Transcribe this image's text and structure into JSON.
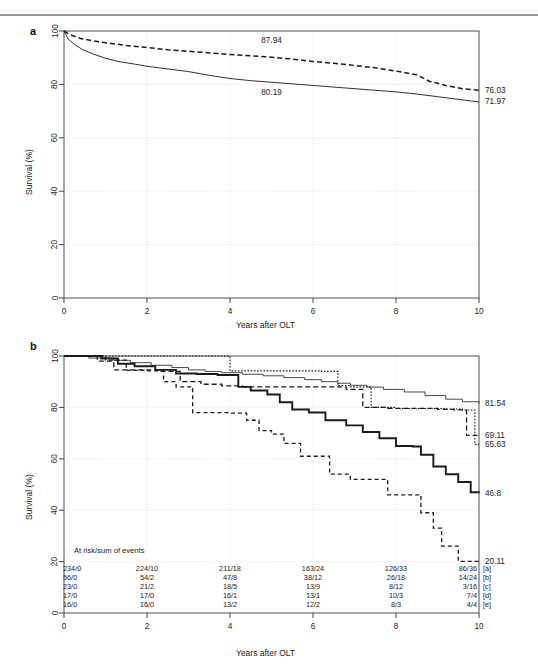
{
  "figure": {
    "panel_a_letter": "a",
    "panel_b_letter": "b",
    "axis": {
      "xlabel": "Years after OLT",
      "ylabel": "Survival (%)",
      "xticks": [
        "0",
        "2",
        "4",
        "6",
        "8",
        "10"
      ],
      "yticks": [
        "0",
        "20",
        "40",
        "60",
        "80",
        "100"
      ]
    }
  },
  "chart_data": [
    {
      "type": "line",
      "panel": "a",
      "title": "",
      "xlabel": "Years after OLT",
      "ylabel": "Survival (%)",
      "xlim": [
        0,
        10
      ],
      "ylim": [
        0,
        100
      ],
      "xticks": [
        0,
        2,
        4,
        6,
        8,
        10
      ],
      "yticks": [
        0,
        20,
        40,
        60,
        80,
        100
      ],
      "grid": true,
      "legend": "none",
      "annotations": [
        {
          "text": "87.94",
          "x": 5.0,
          "y": 95.5,
          "series": "dashed"
        },
        {
          "text": "80.19",
          "x": 5.0,
          "y": 76.0,
          "series": "solid"
        }
      ],
      "end_labels": [
        {
          "text": "76.03",
          "series": "dashed"
        },
        {
          "text": "71.97",
          "series": "solid"
        }
      ],
      "series": [
        {
          "name": "dashed",
          "style": "dashed",
          "x": [
            0,
            0.15,
            0.4,
            0.7,
            1.0,
            1.5,
            2.0,
            2.5,
            3.0,
            3.5,
            4.0,
            4.5,
            5.0,
            5.5,
            6.0,
            6.5,
            7.0,
            7.5,
            8.0,
            8.5,
            8.8,
            9.2,
            9.6,
            10.0
          ],
          "values": [
            100,
            98.6,
            97.2,
            96.3,
            95.6,
            94.6,
            93.8,
            93.0,
            92.4,
            91.8,
            91.2,
            90.7,
            90.2,
            89.5,
            88.6,
            87.9,
            87.1,
            86.2,
            85.0,
            83.6,
            81.2,
            79.6,
            78.4,
            77.8
          ]
        },
        {
          "name": "solid",
          "style": "solid",
          "x": [
            0,
            0.1,
            0.25,
            0.45,
            0.7,
            1.0,
            1.3,
            1.7,
            2.0,
            2.3,
            2.7,
            3.0,
            3.5,
            4.0,
            4.5,
            5.0,
            5.5,
            6.0,
            6.5,
            7.0,
            7.5,
            8.0,
            8.5,
            9.0,
            9.5,
            10.0
          ],
          "values": [
            100,
            97.0,
            95.0,
            93.0,
            91.4,
            89.8,
            88.6,
            87.6,
            86.8,
            86.2,
            85.4,
            84.8,
            83.4,
            82.2,
            81.4,
            80.8,
            80.2,
            79.6,
            79.0,
            78.4,
            77.8,
            77.2,
            76.4,
            75.4,
            74.4,
            73.4
          ]
        }
      ]
    },
    {
      "type": "line",
      "panel": "b",
      "title": "",
      "xlabel": "Years after OLT",
      "ylabel": "Survival (%)",
      "xlim": [
        0,
        10
      ],
      "ylim": [
        0,
        100
      ],
      "xticks": [
        0,
        2,
        4,
        6,
        8,
        10
      ],
      "yticks": [
        0,
        20,
        40,
        60,
        80,
        100
      ],
      "grid": true,
      "legend": "none",
      "step": true,
      "end_labels": [
        {
          "text": "81.54",
          "series": "a",
          "y": 81.54
        },
        {
          "text": "69.11",
          "series": "c",
          "y": 69.11
        },
        {
          "text": "65.63",
          "series": "d",
          "y": 65.63
        },
        {
          "text": "46.8",
          "series": "b",
          "y": 46.8
        },
        {
          "text": "20.11",
          "series": "e",
          "y": 20.11
        }
      ],
      "series": [
        {
          "name": "a",
          "style": "thin-solid",
          "x": [
            0,
            0.6,
            1.2,
            1.6,
            2.1,
            2.6,
            3.0,
            3.4,
            3.8,
            4.3,
            4.8,
            5.3,
            5.8,
            6.2,
            6.6,
            6.9,
            7.3,
            7.7,
            8.2,
            8.7,
            9.2,
            9.6,
            10.0
          ],
          "values": [
            100,
            99.2,
            98.3,
            97.4,
            96.4,
            95.5,
            94.6,
            94.0,
            93.5,
            92.9,
            92.3,
            91.6,
            90.8,
            90.0,
            89.4,
            88.6,
            87.9,
            87.0,
            86.0,
            84.6,
            83.2,
            82.2,
            81.54
          ]
        },
        {
          "name": "b",
          "style": "thick-solid",
          "x": [
            0,
            0.9,
            1.3,
            1.7,
            2.2,
            2.7,
            3.2,
            3.7,
            4.2,
            4.5,
            4.9,
            5.2,
            5.5,
            5.9,
            6.3,
            6.8,
            7.2,
            7.6,
            8.0,
            8.4,
            8.6,
            8.9,
            9.2,
            9.5,
            9.8,
            10.0
          ],
          "values": [
            100,
            99.0,
            97.0,
            96.0,
            94.6,
            93.2,
            93.0,
            92.6,
            88.0,
            86.6,
            85.0,
            82.0,
            79.2,
            78.0,
            75.0,
            73.0,
            70.4,
            68.0,
            65.0,
            64.8,
            61.6,
            57.0,
            54.0,
            51.0,
            47.0,
            46.8
          ]
        },
        {
          "name": "c",
          "style": "dashed-med",
          "x": [
            0,
            0.8,
            1.2,
            1.8,
            2.3,
            2.8,
            3.3,
            3.8,
            4.3,
            4.8,
            5.3,
            5.8,
            6.3,
            6.8,
            7.2,
            7.8,
            8.4,
            9.0,
            9.4,
            9.7,
            10.0
          ],
          "values": [
            100,
            98.0,
            94.6,
            94.6,
            94.0,
            90.0,
            89.0,
            88.4,
            88.0,
            88.0,
            88.0,
            88.0,
            88.0,
            87.0,
            80.0,
            79.6,
            79.6,
            79.2,
            79.0,
            69.11,
            69.11
          ]
        },
        {
          "name": "d",
          "style": "dotted-fine",
          "x": [
            0,
            0.7,
            1.4,
            2.0,
            2.6,
            3.2,
            3.5,
            4.0,
            4.6,
            5.2,
            5.8,
            6.2,
            6.6,
            6.9,
            7.4,
            8.0,
            8.6,
            9.2,
            9.6,
            9.9,
            10.0
          ],
          "values": [
            100,
            100,
            100,
            100,
            100,
            100,
            100,
            94.2,
            94.2,
            94.2,
            94.2,
            94.0,
            88.5,
            88.0,
            80.0,
            79.6,
            79.6,
            79.4,
            79.0,
            65.63,
            65.63
          ]
        },
        {
          "name": "e",
          "style": "dashed-long",
          "x": [
            0,
            1.0,
            1.5,
            2.0,
            2.4,
            2.7,
            3.1,
            3.6,
            4.0,
            4.4,
            4.7,
            5.0,
            5.3,
            5.7,
            6.0,
            6.4,
            6.9,
            7.3,
            7.8,
            8.3,
            8.6,
            8.9,
            9.1,
            9.5,
            10.0
          ],
          "values": [
            100,
            98.4,
            94.4,
            94.2,
            90.0,
            88.0,
            78.0,
            78.0,
            77.8,
            75.0,
            71.0,
            69.6,
            66.0,
            61.0,
            61.0,
            54.0,
            52.0,
            52.0,
            46.0,
            46.0,
            39.0,
            33.0,
            26.0,
            20.11,
            20.11
          ]
        }
      ]
    }
  ],
  "risk_table": {
    "header": "At risk/sum of events",
    "x_positions": [
      0,
      2,
      4,
      6,
      8,
      10
    ],
    "rows": [
      {
        "bracket": "[a]",
        "values": [
          "234/0",
          "224/10",
          "211/18",
          "163/24",
          "126/33",
          "86/36"
        ]
      },
      {
        "bracket": "[b]",
        "values": [
          "56/0",
          "54/2",
          "47/8",
          "38/12",
          "26/18",
          "14/24"
        ]
      },
      {
        "bracket": "[c]",
        "values": [
          "23/0",
          "21/2",
          "18/5",
          "13/9",
          "8/12",
          "3/16"
        ]
      },
      {
        "bracket": "[d]",
        "values": [
          "17/0",
          "17/0",
          "16/1",
          "13/1",
          "10/3",
          "7/4"
        ]
      },
      {
        "bracket": "[e]",
        "values": [
          "16/0",
          "16/0",
          "13/2",
          "12/2",
          "8/3",
          "4/4"
        ]
      }
    ]
  },
  "colors": {
    "line": "#1a1a1a",
    "grid": "#e3e3e3",
    "box": "#555555",
    "rule": "#9a9a9a"
  }
}
